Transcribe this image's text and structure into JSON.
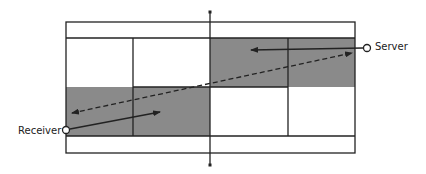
{
  "diagram": {
    "labels": {
      "server": "Server",
      "receiver": "Receiver"
    },
    "colors": {
      "line": "#222222",
      "shade": "#8a8a8a",
      "background": "#ffffff"
    },
    "court": {
      "left": 66,
      "right": 355,
      "top": 22,
      "singles_top": 38,
      "center": 87,
      "singles_bottom": 136,
      "bottom": 153,
      "service_left": 133,
      "net": 210,
      "service_right": 288
    },
    "players": {
      "server": {
        "x": 367,
        "y": 48
      },
      "receiver": {
        "x": 66,
        "y": 130
      }
    },
    "arrows": [
      {
        "name": "server-movement",
        "style": "solid",
        "from": [
          363,
          48
        ],
        "to": [
          251,
          50
        ]
      },
      {
        "name": "receiver-movement",
        "style": "solid",
        "from": [
          70,
          129
        ],
        "to": [
          160,
          112
        ]
      },
      {
        "name": "serve-trajectory",
        "style": "dashed",
        "from": [
          72,
          113
        ],
        "to": [
          352,
          53
        ],
        "bidirectional": true
      }
    ]
  }
}
